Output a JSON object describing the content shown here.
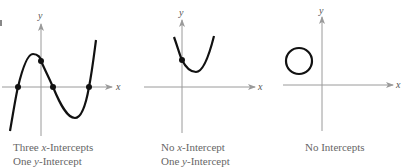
{
  "figure": {
    "panels": [
      {
        "id": "cubic",
        "caption_line1_prefix": "Three ",
        "caption_line1_var": "x",
        "caption_line1_suffix": "-Intercepts",
        "caption_line2_prefix": "One ",
        "caption_line2_var": "y",
        "caption_line2_suffix": "-Intercept",
        "x_label": "x",
        "y_label": "y"
      },
      {
        "id": "parabola",
        "caption_line1_prefix": "No ",
        "caption_line1_var": "x",
        "caption_line1_suffix": "-Intercept",
        "caption_line2_prefix": "One ",
        "caption_line2_var": "y",
        "caption_line2_suffix": "-Intercept",
        "x_label": "x",
        "y_label": "y"
      },
      {
        "id": "circle",
        "caption_line1": "No Intercepts",
        "x_label": "x",
        "y_label": "y"
      }
    ],
    "colors": {
      "curve": "#111111",
      "axis": "#9a9a9a",
      "text": "#666666"
    }
  }
}
